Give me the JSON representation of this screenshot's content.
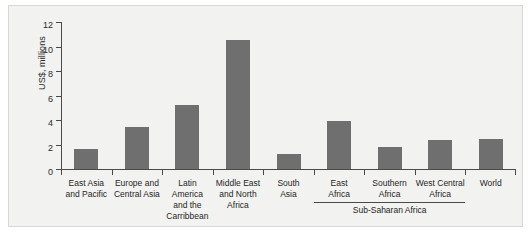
{
  "chart_data": {
    "type": "bar",
    "title": "",
    "subtitle": "",
    "xlabel": "",
    "ylabel": "US$, millions",
    "ylim": [
      0,
      12
    ],
    "yticks": [
      0,
      2,
      4,
      6,
      8,
      10,
      12
    ],
    "ytick_labels": [
      "0",
      "2",
      "4",
      "6",
      "8",
      "10",
      "12"
    ],
    "grid": false,
    "legend": null,
    "bar_color": "#6f6f6f",
    "background_color": "#f2f2f0",
    "axis_color": "#4a4a4a",
    "categories": [
      "East Asia\nand Pacific",
      "Europe and\nCentral Asia",
      "Latin\nAmerica\nand the\nCarribbean",
      "Middle East\nand North\nAfrica",
      "South\nAsia",
      "East\nAfrica",
      "Southern\nAfrica",
      "West Central\nAfrica",
      "World"
    ],
    "values": [
      1.65,
      3.4,
      5.2,
      10.55,
      1.25,
      3.95,
      1.8,
      2.35,
      2.45
    ],
    "annotations": [
      {
        "text": "Sub-Saharan Africa",
        "covers": [
          "East\nAfrica",
          "Southern\nAfrica",
          "West Central\nAfrica"
        ],
        "type": "group-bracket"
      }
    ]
  }
}
